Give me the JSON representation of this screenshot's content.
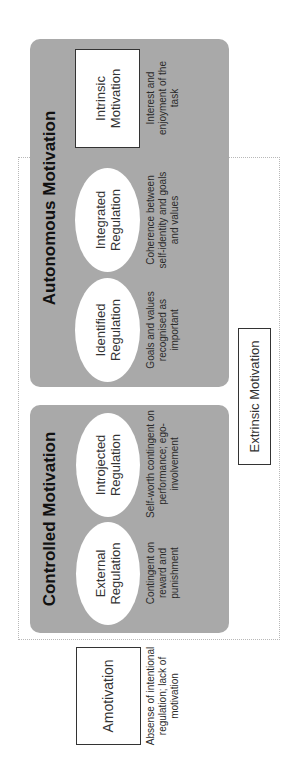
{
  "diagram": {
    "type": "self-determination-continuum",
    "orientation": "rotated 90 degrees counter-clockwise",
    "colors": {
      "group_fill": "#a9a9a9",
      "box_fill": "#ffffff",
      "box_border": "#333333",
      "dotted_outline": "#b8b8b8"
    },
    "amotivation": {
      "label": "Amotivation",
      "description": "Absense of intentional regulation; lack of motivation"
    },
    "extrinsic": {
      "label": "Extrinsic Motivation"
    },
    "controlled": {
      "title": "Controlled Motivation",
      "items": [
        {
          "label_line1": "External",
          "label_line2": "Regulation",
          "description": "Contingent on reward and punishment"
        },
        {
          "label_line1": "Introjected",
          "label_line2": "Regulation",
          "description": "Self-worth contingent on performance; ego-involvement"
        }
      ]
    },
    "autonomous": {
      "title": "Autonomous Motivation",
      "items": [
        {
          "label_line1": "Identified",
          "label_line2": "Regulation",
          "description": "Goals and values recognised as important"
        },
        {
          "label_line1": "Integrated",
          "label_line2": "Regulation",
          "description": "Coherence between self-identity and goals and values"
        }
      ],
      "intrinsic": {
        "label_line1": "Intrinsic",
        "label_line2": "Motivation",
        "description": "Interest and enjoyment of the task"
      }
    }
  }
}
